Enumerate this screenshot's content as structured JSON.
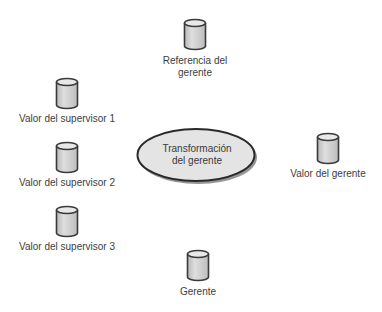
{
  "diagram": {
    "center": {
      "line1": "Transformación",
      "line2": "del gerente"
    },
    "nodes": {
      "referencia": {
        "line1": "Referencia del",
        "line2": "gerente"
      },
      "supervisor1": {
        "label": "Valor del supervisor 1"
      },
      "supervisor2": {
        "label": "Valor del supervisor 2"
      },
      "supervisor3": {
        "label": "Valor del supervisor 3"
      },
      "valor_gerente": {
        "label": "Valor del gerente"
      },
      "gerente": {
        "label": "Gerente"
      }
    },
    "colors": {
      "cylinder_fill": "#d4d4d4",
      "cylinder_stroke": "#3a3a3a",
      "ellipse_fill": "#e4e4e4",
      "ellipse_stroke": "#2a2a2a",
      "text": "#3d3d3d"
    }
  }
}
